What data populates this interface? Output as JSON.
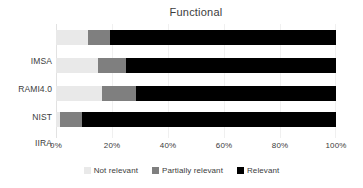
{
  "chart_data": {
    "type": "bar",
    "orientation": "horizontal",
    "stacked": true,
    "normalized": true,
    "title": "Functional",
    "xlabel": "",
    "ylabel": "",
    "xlim": [
      0,
      100
    ],
    "grid": true,
    "legend_position": "bottom",
    "categories": [
      "IMSA",
      "RAMI4.0",
      "NIST",
      "IIRA"
    ],
    "xtick_labels": [
      "0%",
      "20%",
      "40%",
      "60%",
      "80%",
      "100%"
    ],
    "xtick_values": [
      0,
      20,
      40,
      60,
      80,
      100
    ],
    "series": [
      {
        "name": "Not relevant",
        "color": "#e9e9e9",
        "values": [
          11.4,
          15.0,
          16.4,
          1.4
        ]
      },
      {
        "name": "Partially relevant",
        "color": "#7f7f7f",
        "values": [
          7.9,
          10.0,
          12.1,
          7.9
        ]
      },
      {
        "name": "Relevant",
        "color": "#000000",
        "values": [
          80.7,
          75.0,
          71.5,
          90.7
        ]
      }
    ]
  }
}
